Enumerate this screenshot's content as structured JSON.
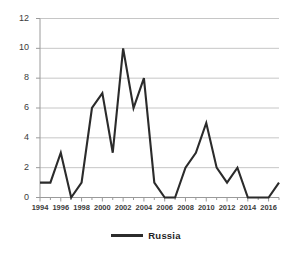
{
  "chart_data": {
    "type": "line",
    "title": "",
    "xlabel": "",
    "ylabel": "",
    "x": [
      1994,
      1995,
      1996,
      1997,
      1998,
      1999,
      2000,
      2001,
      2002,
      2003,
      2004,
      2005,
      2006,
      2007,
      2008,
      2009,
      2010,
      2011,
      2012,
      2013,
      2014,
      2015,
      2016,
      2017
    ],
    "series": [
      {
        "name": "Russia",
        "color": "#2b2b2b",
        "values": [
          1,
          1,
          3,
          0,
          1,
          6,
          7,
          3,
          10,
          6,
          8,
          1,
          0,
          0,
          2,
          3,
          5,
          2,
          1,
          2,
          0,
          0,
          0,
          1
        ]
      }
    ],
    "ylim": [
      0,
      12
    ],
    "xlim": [
      1994,
      2017
    ],
    "ytick_labels": [
      "0",
      "2",
      "4",
      "6",
      "8",
      "10",
      "12"
    ],
    "ytick_values": [
      0,
      2,
      4,
      6,
      8,
      10,
      12
    ],
    "xtick_labels": [
      "1994",
      "1996",
      "1998",
      "2000",
      "2002",
      "2004",
      "2006",
      "2008",
      "2010",
      "2012",
      "2014",
      "2016"
    ],
    "xtick_values": [
      1994,
      1996,
      1998,
      2000,
      2002,
      2004,
      2006,
      2008,
      2010,
      2012,
      2014,
      2016
    ],
    "grid": true,
    "grid_axis": "y",
    "grid_color": "#bfbfbf",
    "axis_color": "#9a9a9a",
    "background": "#ffffff",
    "legend_position": "bottom"
  },
  "legend": {
    "entries": [
      {
        "label": "Russia",
        "marker": "line-swatch"
      }
    ]
  }
}
